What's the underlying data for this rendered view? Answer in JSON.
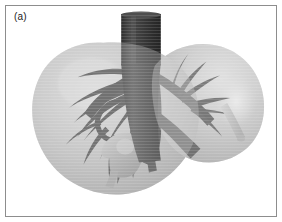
{
  "figure": {
    "panel_label": "(a)",
    "caption_visible": false,
    "modality": "3d-surface-rendering",
    "colorspace": "grayscale",
    "background_color": "#ffffff",
    "border_color": "#8d8d8d"
  },
  "anatomy": {
    "organ": "liver",
    "parts": [
      {
        "name": "liver-parenchyma-left-lobe",
        "appearance": "semi-transparent light gray lobe",
        "color": "#b9b9b9"
      },
      {
        "name": "liver-parenchyma-right-lobe",
        "appearance": "semi-transparent light gray lobe",
        "color": "#c2c2c2"
      },
      {
        "name": "inferior-vena-cava",
        "appearance": "dark vertical cylinder at top center",
        "color": "#3a3a3a"
      },
      {
        "name": "hepatic-vein-tree",
        "appearance": "dark branching vessels",
        "color": "#474747"
      },
      {
        "name": "portal-vein-tree",
        "appearance": "dark branching vessels",
        "color": "#3f3f3f"
      },
      {
        "name": "gallbladder",
        "appearance": "mid gray rounded sac below hilum",
        "color": "#a8a8a8"
      },
      {
        "name": "bile-duct",
        "appearance": "light gray tube at right margin",
        "color": "#bdbdbd"
      }
    ]
  },
  "palette": {
    "vessel_dark": "#3a3a3a",
    "vessel_mid": "#4f4f4f",
    "parenchyma_light": "#d4d4d4",
    "parenchyma_mid": "#b5b5b5",
    "parenchyma_shadow": "#9a9a9a",
    "gallbladder": "#a8a8a8",
    "duct": "#bdbdbd",
    "label_text": "#1c1c1c"
  }
}
